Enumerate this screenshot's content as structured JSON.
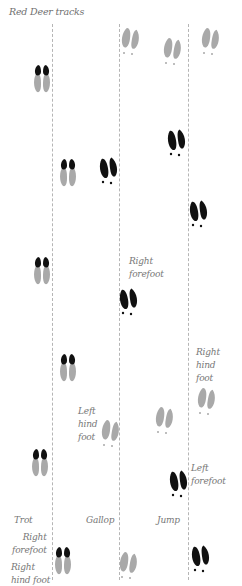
{
  "title": "Red Deer tracks",
  "colors": {
    "forefoot": "#111111",
    "hindfoot": "#a9a9a9",
    "line": "#b5b5b5",
    "text": "#777777"
  },
  "gaits": [
    {
      "name": "Trot",
      "label_x": 14,
      "label_y": 514
    },
    {
      "name": "Gallop",
      "label_x": 86,
      "label_y": 514
    },
    {
      "name": "Jump",
      "label_x": 157,
      "label_y": 514
    }
  ],
  "divider_lines_x": [
    52,
    119,
    188
  ],
  "annotations": [
    {
      "id": "trot-right-forefoot",
      "text": "Right\nforefoot",
      "x": 12,
      "y": 531,
      "align": "right"
    },
    {
      "id": "trot-right-hind-foot",
      "text": "Right\nhind foot",
      "x": 11,
      "y": 561,
      "align": "left"
    },
    {
      "id": "gallop-right-forefoot",
      "text": "Right\nforefoot",
      "x": 129,
      "y": 255,
      "align": "left"
    },
    {
      "id": "gallop-left-hind-foot",
      "text": "Left\nhind\nfoot",
      "x": 78,
      "y": 405,
      "align": "left"
    },
    {
      "id": "jump-right-hind-foot",
      "text": "Right\nhind\nfoot",
      "x": 196,
      "y": 346,
      "align": "left"
    },
    {
      "id": "jump-left-forefoot",
      "text": "Left\nforefoot",
      "x": 191,
      "y": 462,
      "align": "left"
    }
  ],
  "tracks": [
    {
      "gait": "Trot",
      "type": "overlap",
      "x": 31,
      "y": 64
    },
    {
      "gait": "Trot",
      "type": "overlap",
      "x": 57,
      "y": 158
    },
    {
      "gait": "Trot",
      "type": "overlap",
      "x": 31,
      "y": 256
    },
    {
      "gait": "Trot",
      "type": "overlap",
      "x": 57,
      "y": 353
    },
    {
      "gait": "Trot",
      "type": "overlap",
      "x": 29,
      "y": 448
    },
    {
      "gait": "Trot",
      "type": "overlap",
      "x": 52,
      "y": 546
    },
    {
      "gait": "Gallop",
      "type": "hind",
      "x": 120,
      "y": 26
    },
    {
      "gait": "Gallop",
      "type": "fore",
      "x": 98,
      "y": 155
    },
    {
      "gait": "Gallop",
      "type": "fore",
      "x": 118,
      "y": 286
    },
    {
      "gait": "Gallop",
      "type": "hind",
      "x": 100,
      "y": 418
    },
    {
      "gait": "Gallop",
      "type": "hind",
      "x": 118,
      "y": 550
    },
    {
      "gait": "Jump",
      "type": "hind",
      "x": 162,
      "y": 36
    },
    {
      "gait": "Jump",
      "type": "hind",
      "x": 200,
      "y": 26
    },
    {
      "gait": "Jump",
      "type": "fore",
      "x": 166,
      "y": 127
    },
    {
      "gait": "Jump",
      "type": "fore",
      "x": 188,
      "y": 198
    },
    {
      "gait": "Jump",
      "type": "hind",
      "x": 154,
      "y": 405
    },
    {
      "gait": "Jump",
      "type": "hind",
      "x": 196,
      "y": 386
    },
    {
      "gait": "Jump",
      "type": "fore",
      "x": 168,
      "y": 468
    },
    {
      "gait": "Jump",
      "type": "fore",
      "x": 190,
      "y": 543
    }
  ]
}
